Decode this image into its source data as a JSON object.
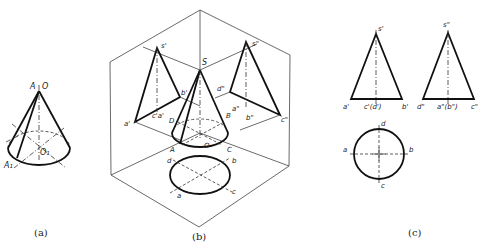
{
  "figure": {
    "panels": [
      {
        "id": "a",
        "caption": "(a)",
        "labels": {
          "apex_a": "A",
          "apex_o": "O",
          "base_point": "A₁",
          "base_center": "O₁"
        }
      },
      {
        "id": "b",
        "caption": "(b)",
        "labels": {
          "s_prime": "s'",
          "s_double": "s\"",
          "S": "S",
          "a_prime": "a'",
          "b_prime": "b'",
          "c_a_prime": "c'a'",
          "d_double": "d\"",
          "a_double": "a\"",
          "b_double": "b\"",
          "c_double": "c\"",
          "D": "D",
          "B": "B",
          "A": "A",
          "O": "O",
          "C": "C",
          "d": "d",
          "b": "b",
          "a": "a",
          "c": "c"
        }
      },
      {
        "id": "c",
        "caption": "(c)",
        "labels": {
          "s_prime": "s'",
          "a_prime": "a'",
          "c_d_prime": "c'(d')",
          "b_prime": "b'",
          "s_double": "s\"",
          "d_double": "d\"",
          "a_b_double": "a\"(b\")",
          "c_double": "c\"",
          "d": "d",
          "a": "a",
          "b": "b",
          "c": "c"
        }
      }
    ]
  }
}
